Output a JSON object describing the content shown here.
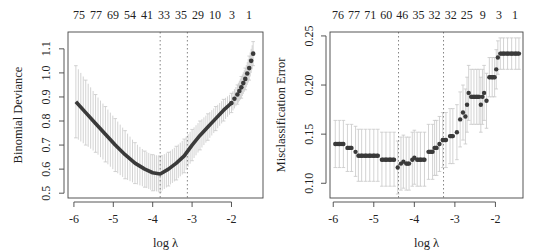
{
  "chart_data": [
    {
      "type": "scatter",
      "panel": "left",
      "title": "",
      "xlabel": "log λ",
      "ylabel": "Binomial Deviance",
      "xlim": [
        -6.15,
        -1.2
      ],
      "ylim": [
        0.48,
        1.17
      ],
      "xticks": [
        -6,
        -5,
        -4,
        -3,
        -2
      ],
      "yticks": [
        0.5,
        0.6,
        0.7,
        0.8,
        0.9,
        1.0,
        1.1
      ],
      "ytick_labels": [
        "0.5",
        "0.6",
        "0.7",
        "0.8",
        "0.9",
        "1.0",
        "1.1"
      ],
      "top_axis_labels": [
        "75",
        "77",
        "69",
        "54",
        "41",
        "33",
        "35",
        "29",
        "10",
        "3",
        "1"
      ],
      "vlines": [
        -3.81,
        -3.12
      ],
      "grid": false,
      "legend": null,
      "series": [
        {
          "name": "cv mean with 1-SE error bars",
          "x": [
            -5.95,
            -5.7,
            -5.45,
            -5.2,
            -4.95,
            -4.7,
            -4.45,
            -4.2,
            -4.0,
            -3.81,
            -3.6,
            -3.4,
            -3.2,
            -3.0,
            -2.8,
            -2.6,
            -2.4,
            -2.2,
            -2.0,
            -1.85,
            -1.75,
            -1.65,
            -1.55,
            -1.45
          ],
          "y": [
            0.88,
            0.835,
            0.79,
            0.745,
            0.7,
            0.66,
            0.625,
            0.6,
            0.585,
            0.58,
            0.6,
            0.625,
            0.655,
            0.7,
            0.74,
            0.775,
            0.81,
            0.845,
            0.875,
            0.91,
            0.94,
            0.975,
            1.02,
            1.08
          ],
          "upper": [
            1.03,
            0.97,
            0.91,
            0.86,
            0.81,
            0.76,
            0.71,
            0.675,
            0.66,
            0.655,
            0.67,
            0.695,
            0.725,
            0.765,
            0.8,
            0.83,
            0.86,
            0.89,
            0.915,
            0.95,
            0.985,
            1.02,
            1.07,
            1.13
          ],
          "lower": [
            0.73,
            0.7,
            0.67,
            0.63,
            0.59,
            0.56,
            0.54,
            0.525,
            0.51,
            0.505,
            0.53,
            0.555,
            0.585,
            0.635,
            0.68,
            0.72,
            0.76,
            0.8,
            0.835,
            0.87,
            0.895,
            0.93,
            0.97,
            1.03
          ]
        }
      ]
    },
    {
      "type": "scatter",
      "panel": "right",
      "title": "",
      "xlabel": "log λ",
      "ylabel": "Misclassification Error",
      "xlim": [
        -6.08,
        -1.32
      ],
      "ylim": [
        0.085,
        0.254
      ],
      "xticks": [
        -6,
        -5,
        -4,
        -3,
        -2
      ],
      "yticks": [
        0.1,
        0.15,
        0.2,
        0.25
      ],
      "ytick_labels": [
        "0.10",
        "0.15",
        "0.20",
        "0.25"
      ],
      "top_axis_labels": [
        "76",
        "77",
        "71",
        "60",
        "46",
        "35",
        "32",
        "32",
        "25",
        "9",
        "3",
        "1"
      ],
      "vlines": [
        -4.39,
        -3.28
      ],
      "grid": false,
      "legend": null,
      "series": [
        {
          "name": "cv misclassification with 1-SE error bars",
          "x": [
            -5.95,
            -5.85,
            -5.75,
            -5.65,
            -5.55,
            -5.45,
            -5.38,
            -5.3,
            -5.2,
            -5.1,
            -5.0,
            -4.9,
            -4.8,
            -4.7,
            -4.6,
            -4.5,
            -4.41,
            -4.33,
            -4.27,
            -4.2,
            -4.13,
            -4.05,
            -4.0,
            -3.93,
            -3.85,
            -3.75,
            -3.65,
            -3.55,
            -3.5,
            -3.45,
            -3.38,
            -3.3,
            -3.22,
            -3.12,
            -3.05,
            -2.95,
            -2.87,
            -2.8,
            -2.74,
            -2.7,
            -2.66,
            -2.6,
            -2.53,
            -2.46,
            -2.4,
            -2.36,
            -2.32,
            -2.28,
            -2.22,
            -2.15,
            -2.08,
            -2.02,
            -1.98,
            -1.94,
            -1.88,
            -1.8,
            -1.7,
            -1.6,
            -1.5,
            -1.42
          ],
          "y": [
            0.14,
            0.14,
            0.14,
            0.136,
            0.136,
            0.132,
            0.128,
            0.128,
            0.128,
            0.128,
            0.128,
            0.128,
            0.124,
            0.124,
            0.124,
            0.124,
            0.116,
            0.12,
            0.122,
            0.12,
            0.12,
            0.124,
            0.126,
            0.124,
            0.124,
            0.124,
            0.132,
            0.132,
            0.136,
            0.136,
            0.14,
            0.144,
            0.144,
            0.148,
            0.148,
            0.152,
            0.165,
            0.172,
            0.168,
            0.18,
            0.192,
            0.188,
            0.188,
            0.188,
            0.188,
            0.18,
            0.188,
            0.192,
            0.184,
            0.208,
            0.208,
            0.208,
            0.216,
            0.228,
            0.232,
            0.232,
            0.232,
            0.232,
            0.232,
            0.232
          ],
          "upper": [
            0.164,
            0.164,
            0.164,
            0.16,
            0.16,
            0.158,
            0.155,
            0.155,
            0.155,
            0.155,
            0.155,
            0.155,
            0.152,
            0.152,
            0.152,
            0.152,
            0.143,
            0.147,
            0.149,
            0.147,
            0.147,
            0.152,
            0.154,
            0.152,
            0.152,
            0.152,
            0.16,
            0.16,
            0.164,
            0.164,
            0.168,
            0.172,
            0.172,
            0.176,
            0.176,
            0.18,
            0.193,
            0.2,
            0.196,
            0.208,
            0.22,
            0.216,
            0.216,
            0.216,
            0.216,
            0.208,
            0.216,
            0.22,
            0.212,
            0.228,
            0.228,
            0.228,
            0.236,
            0.245,
            0.248,
            0.248,
            0.248,
            0.248,
            0.248,
            0.248
          ],
          "lower": [
            0.116,
            0.116,
            0.116,
            0.112,
            0.112,
            0.107,
            0.102,
            0.102,
            0.102,
            0.102,
            0.102,
            0.102,
            0.097,
            0.097,
            0.097,
            0.097,
            0.089,
            0.093,
            0.095,
            0.093,
            0.093,
            0.097,
            0.099,
            0.097,
            0.097,
            0.097,
            0.104,
            0.104,
            0.108,
            0.108,
            0.112,
            0.116,
            0.116,
            0.12,
            0.12,
            0.124,
            0.137,
            0.144,
            0.14,
            0.152,
            0.164,
            0.16,
            0.16,
            0.16,
            0.16,
            0.152,
            0.16,
            0.164,
            0.156,
            0.188,
            0.188,
            0.188,
            0.196,
            0.211,
            0.216,
            0.216,
            0.216,
            0.216,
            0.216,
            0.216
          ]
        }
      ]
    }
  ],
  "layout": {
    "panels": [
      {
        "box": [
          68,
          32,
          263,
          198
        ],
        "ylabel_x": 22,
        "ytick_label_x": 50,
        "point_radius": 2.3,
        "point_color": "#3a3a3a",
        "bar_color": "#c8c8c8"
      },
      {
        "box": [
          330,
          32,
          523,
          198
        ],
        "ylabel_x": 285,
        "ytick_label_x": 313,
        "point_radius": 2.2,
        "point_color": "#3a3a3a",
        "bar_color": "#c8c8c8"
      }
    ],
    "axis_color": "#444444",
    "vline_color": "#666666"
  }
}
